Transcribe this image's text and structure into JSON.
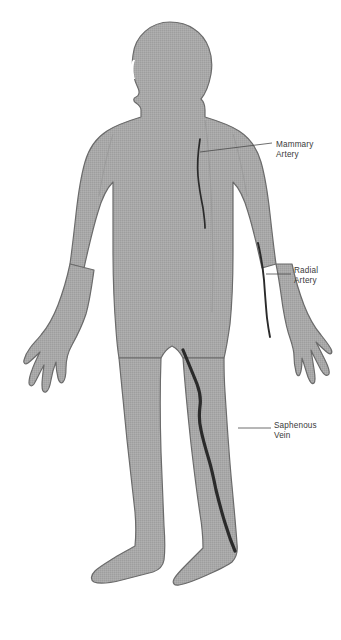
{
  "diagram": {
    "background_color": "#ffffff",
    "body": {
      "fill_color": "#a5a5a5",
      "outline_color": "#6b6b6b",
      "texture": "fine-dither-halftone"
    },
    "vessel_color": "#2a2a2a",
    "label_color": "#3a3a3a",
    "leader_color": "#4a4a4a"
  },
  "labels": [
    {
      "id": "mammary-artery",
      "name": "mammary-artery-label",
      "line1": "Mammary",
      "line2": "Artery",
      "vessel": "internal mammary artery",
      "location": "chest",
      "leader": {
        "x1": 200,
        "y1": 152,
        "x2": 272,
        "y2": 143
      }
    },
    {
      "id": "radial-artery",
      "name": "radial-artery-label",
      "line1": "Radial",
      "line2": "Artery",
      "vessel": "radial artery",
      "location": "left forearm",
      "leader": {
        "x1": 266,
        "y1": 274,
        "x2": 291,
        "y2": 274
      }
    },
    {
      "id": "saphenous-vein",
      "name": "saphenous-vein-label",
      "line1": "Saphenous",
      "line2": "Vein",
      "vessel": "great saphenous vein",
      "location": "right leg",
      "leader": {
        "x1": 238,
        "y1": 428,
        "x2": 271,
        "y2": 428
      }
    }
  ]
}
